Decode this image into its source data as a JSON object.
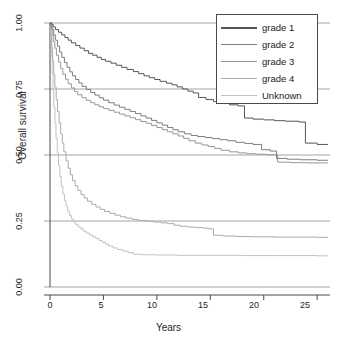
{
  "chart_data": {
    "type": "line",
    "subtype": "kaplan-meier-step",
    "title": "",
    "xlabel": "Years",
    "ylabel": "Overall survival",
    "xlim": [
      0,
      26.2
    ],
    "ylim": [
      0.0,
      1.02
    ],
    "xticks": [
      0,
      5,
      10,
      15,
      20,
      25
    ],
    "xticklabels": [
      "0",
      "5",
      "10",
      "15",
      "20",
      "25"
    ],
    "yticks": [
      0.0,
      0.25,
      0.5,
      0.75,
      1.0
    ],
    "yticklabels": [
      "0.00",
      "0.25",
      "0.50",
      "0.75",
      "1.00"
    ],
    "grid": true,
    "gridlines_y": [
      0.0,
      0.25,
      0.5,
      0.75,
      1.0
    ],
    "legend_position": "top-right",
    "legend_entries": [
      "grade 1",
      "grade 2",
      "grade 3",
      "grade 4",
      "Unknown"
    ],
    "series": [
      {
        "name": "grade 1",
        "color": "#55555a",
        "final_value": 0.54,
        "points": [
          [
            0.0,
            1.0
          ],
          [
            0.15,
            0.995
          ],
          [
            0.3,
            0.985
          ],
          [
            0.5,
            0.975
          ],
          [
            0.8,
            0.965
          ],
          [
            1.1,
            0.955
          ],
          [
            1.4,
            0.945
          ],
          [
            1.7,
            0.935
          ],
          [
            2.0,
            0.925
          ],
          [
            2.4,
            0.915
          ],
          [
            2.8,
            0.905
          ],
          [
            3.2,
            0.895
          ],
          [
            3.6,
            0.885
          ],
          [
            4.0,
            0.878
          ],
          [
            4.4,
            0.87
          ],
          [
            4.8,
            0.862
          ],
          [
            5.2,
            0.855
          ],
          [
            5.7,
            0.848
          ],
          [
            6.2,
            0.84
          ],
          [
            6.7,
            0.832
          ],
          [
            7.2,
            0.824
          ],
          [
            7.8,
            0.816
          ],
          [
            8.3,
            0.808
          ],
          [
            8.8,
            0.8
          ],
          [
            9.3,
            0.793
          ],
          [
            9.8,
            0.786
          ],
          [
            10.3,
            0.779
          ],
          [
            10.9,
            0.772
          ],
          [
            11.4,
            0.766
          ],
          [
            11.9,
            0.758
          ],
          [
            12.4,
            0.75
          ],
          [
            12.9,
            0.742
          ],
          [
            13.4,
            0.735
          ],
          [
            13.9,
            0.718
          ],
          [
            14.6,
            0.71
          ],
          [
            15.3,
            0.702
          ],
          [
            16.0,
            0.695
          ],
          [
            16.8,
            0.69
          ],
          [
            17.6,
            0.686
          ],
          [
            18.2,
            0.64
          ],
          [
            19.0,
            0.636
          ],
          [
            20.0,
            0.633
          ],
          [
            21.0,
            0.63
          ],
          [
            22.0,
            0.628
          ],
          [
            23.3,
            0.625
          ],
          [
            23.9,
            0.545
          ],
          [
            25.0,
            0.54
          ],
          [
            26.0,
            0.54
          ]
        ]
      },
      {
        "name": "grade 2",
        "color": "#7d7d82",
        "final_value": 0.48,
        "points": [
          [
            0.0,
            1.0
          ],
          [
            0.1,
            0.99
          ],
          [
            0.2,
            0.975
          ],
          [
            0.35,
            0.955
          ],
          [
            0.5,
            0.935
          ],
          [
            0.7,
            0.912
          ],
          [
            0.9,
            0.89
          ],
          [
            1.1,
            0.87
          ],
          [
            1.35,
            0.85
          ],
          [
            1.6,
            0.832
          ],
          [
            1.85,
            0.815
          ],
          [
            2.1,
            0.8
          ],
          [
            2.4,
            0.786
          ],
          [
            2.7,
            0.773
          ],
          [
            3.0,
            0.76
          ],
          [
            3.4,
            0.748
          ],
          [
            3.8,
            0.737
          ],
          [
            4.2,
            0.727
          ],
          [
            4.6,
            0.717
          ],
          [
            5.0,
            0.708
          ],
          [
            5.5,
            0.698
          ],
          [
            6.0,
            0.689
          ],
          [
            6.5,
            0.681
          ],
          [
            7.0,
            0.673
          ],
          [
            7.5,
            0.665
          ],
          [
            8.0,
            0.657
          ],
          [
            8.5,
            0.648
          ],
          [
            9.0,
            0.64
          ],
          [
            9.5,
            0.631
          ],
          [
            10.0,
            0.622
          ],
          [
            10.5,
            0.613
          ],
          [
            11.0,
            0.604
          ],
          [
            11.5,
            0.596
          ],
          [
            12.0,
            0.588
          ],
          [
            12.6,
            0.58
          ],
          [
            13.2,
            0.574
          ],
          [
            13.8,
            0.57
          ],
          [
            14.5,
            0.566
          ],
          [
            15.2,
            0.562
          ],
          [
            15.9,
            0.558
          ],
          [
            16.6,
            0.554
          ],
          [
            17.4,
            0.548
          ],
          [
            18.2,
            0.544
          ],
          [
            19.0,
            0.54
          ],
          [
            19.8,
            0.52
          ],
          [
            20.6,
            0.515
          ],
          [
            21.2,
            0.487
          ],
          [
            22.2,
            0.484
          ],
          [
            23.4,
            0.482
          ],
          [
            25.0,
            0.48
          ],
          [
            26.0,
            0.48
          ]
        ]
      },
      {
        "name": "grade 3",
        "color": "#96969b",
        "final_value": 0.47,
        "points": [
          [
            0.0,
            1.0
          ],
          [
            0.1,
            0.98
          ],
          [
            0.2,
            0.955
          ],
          [
            0.3,
            0.93
          ],
          [
            0.45,
            0.905
          ],
          [
            0.6,
            0.878
          ],
          [
            0.8,
            0.852
          ],
          [
            1.0,
            0.828
          ],
          [
            1.2,
            0.806
          ],
          [
            1.45,
            0.787
          ],
          [
            1.7,
            0.77
          ],
          [
            2.0,
            0.754
          ],
          [
            2.3,
            0.74
          ],
          [
            2.6,
            0.728
          ],
          [
            3.0,
            0.717
          ],
          [
            3.4,
            0.707
          ],
          [
            3.8,
            0.698
          ],
          [
            4.2,
            0.69
          ],
          [
            4.6,
            0.683
          ],
          [
            5.0,
            0.676
          ],
          [
            5.5,
            0.669
          ],
          [
            6.0,
            0.662
          ],
          [
            6.5,
            0.655
          ],
          [
            7.0,
            0.648
          ],
          [
            7.5,
            0.641
          ],
          [
            8.0,
            0.634
          ],
          [
            8.5,
            0.627
          ],
          [
            9.0,
            0.62
          ],
          [
            9.5,
            0.612
          ],
          [
            10.0,
            0.604
          ],
          [
            10.5,
            0.596
          ],
          [
            11.0,
            0.588
          ],
          [
            11.5,
            0.58
          ],
          [
            12.0,
            0.572
          ],
          [
            12.5,
            0.563
          ],
          [
            13.0,
            0.554
          ],
          [
            13.6,
            0.545
          ],
          [
            14.2,
            0.538
          ],
          [
            14.8,
            0.532
          ],
          [
            15.4,
            0.525
          ],
          [
            16.0,
            0.518
          ],
          [
            16.8,
            0.512
          ],
          [
            17.6,
            0.508
          ],
          [
            18.4,
            0.505
          ],
          [
            19.2,
            0.503
          ],
          [
            20.2,
            0.501
          ],
          [
            21.0,
            0.5
          ],
          [
            21.3,
            0.473
          ],
          [
            22.5,
            0.471
          ],
          [
            24.0,
            0.47
          ],
          [
            26.0,
            0.47
          ]
        ]
      },
      {
        "name": "grade 4",
        "color": "#aaaaaf",
        "final_value": 0.19,
        "points": [
          [
            0.0,
            1.0
          ],
          [
            0.08,
            0.955
          ],
          [
            0.16,
            0.905
          ],
          [
            0.25,
            0.855
          ],
          [
            0.35,
            0.805
          ],
          [
            0.45,
            0.757
          ],
          [
            0.58,
            0.71
          ],
          [
            0.7,
            0.665
          ],
          [
            0.85,
            0.622
          ],
          [
            1.0,
            0.58
          ],
          [
            1.15,
            0.545
          ],
          [
            1.3,
            0.512
          ],
          [
            1.5,
            0.478
          ],
          [
            1.7,
            0.45
          ],
          [
            1.9,
            0.425
          ],
          [
            2.1,
            0.403
          ],
          [
            2.35,
            0.383
          ],
          [
            2.6,
            0.366
          ],
          [
            2.9,
            0.35
          ],
          [
            3.2,
            0.337
          ],
          [
            3.5,
            0.325
          ],
          [
            3.9,
            0.313
          ],
          [
            4.3,
            0.303
          ],
          [
            4.7,
            0.294
          ],
          [
            5.1,
            0.286
          ],
          [
            5.6,
            0.279
          ],
          [
            6.1,
            0.272
          ],
          [
            6.6,
            0.266
          ],
          [
            7.1,
            0.261
          ],
          [
            7.7,
            0.256
          ],
          [
            8.3,
            0.252
          ],
          [
            9.0,
            0.249
          ],
          [
            9.7,
            0.246
          ],
          [
            10.4,
            0.243
          ],
          [
            11.0,
            0.24
          ],
          [
            11.6,
            0.234
          ],
          [
            12.2,
            0.23
          ],
          [
            12.9,
            0.227
          ],
          [
            13.6,
            0.225
          ],
          [
            14.3,
            0.223
          ],
          [
            14.9,
            0.22
          ],
          [
            15.3,
            0.196
          ],
          [
            16.2,
            0.193
          ],
          [
            17.5,
            0.191
          ],
          [
            19.0,
            0.19
          ],
          [
            21.0,
            0.189
          ],
          [
            23.0,
            0.189
          ],
          [
            25.0,
            0.188
          ],
          [
            26.0,
            0.188
          ]
        ]
      },
      {
        "name": "Unknown",
        "color": "#c2c2c6",
        "final_value": 0.12,
        "points": [
          [
            0.0,
            1.0
          ],
          [
            0.06,
            0.94
          ],
          [
            0.12,
            0.875
          ],
          [
            0.2,
            0.81
          ],
          [
            0.28,
            0.745
          ],
          [
            0.36,
            0.682
          ],
          [
            0.46,
            0.62
          ],
          [
            0.56,
            0.562
          ],
          [
            0.68,
            0.508
          ],
          [
            0.8,
            0.46
          ],
          [
            0.92,
            0.418
          ],
          [
            1.05,
            0.382
          ],
          [
            1.2,
            0.352
          ],
          [
            1.35,
            0.327
          ],
          [
            1.5,
            0.306
          ],
          [
            1.65,
            0.288
          ],
          [
            1.8,
            0.272
          ],
          [
            2.0,
            0.258
          ],
          [
            2.2,
            0.246
          ],
          [
            2.4,
            0.236
          ],
          [
            2.65,
            0.227
          ],
          [
            2.9,
            0.219
          ],
          [
            3.15,
            0.211
          ],
          [
            3.4,
            0.204
          ],
          [
            3.7,
            0.197
          ],
          [
            4.0,
            0.19
          ],
          [
            4.3,
            0.183
          ],
          [
            4.6,
            0.176
          ],
          [
            4.9,
            0.169
          ],
          [
            5.2,
            0.162
          ],
          [
            5.5,
            0.155
          ],
          [
            5.9,
            0.148
          ],
          [
            6.3,
            0.142
          ],
          [
            6.8,
            0.136
          ],
          [
            7.3,
            0.13
          ],
          [
            7.8,
            0.124
          ],
          [
            8.6,
            0.122
          ],
          [
            10.0,
            0.121
          ],
          [
            12.0,
            0.12
          ],
          [
            15.0,
            0.12
          ],
          [
            18.0,
            0.119
          ],
          [
            21.0,
            0.119
          ],
          [
            25.0,
            0.118
          ],
          [
            26.0,
            0.118
          ]
        ]
      }
    ]
  },
  "axes": {
    "ylabel": "Overall survival",
    "xlabel": "Years",
    "yticklabels": [
      "1.00",
      "0.75",
      "0.50",
      "0.25",
      "0.00"
    ],
    "xticklabels": [
      "0",
      "5",
      "10",
      "15",
      "20",
      "25"
    ]
  },
  "legend": {
    "items": [
      {
        "label": "grade 1",
        "color": "#55555a"
      },
      {
        "label": "grade 2",
        "color": "#7d7d82"
      },
      {
        "label": "grade 3",
        "color": "#96969b"
      },
      {
        "label": "grade 4",
        "color": "#aaaaaf"
      },
      {
        "label": "Unknown",
        "color": "#c2c2c6"
      }
    ]
  }
}
